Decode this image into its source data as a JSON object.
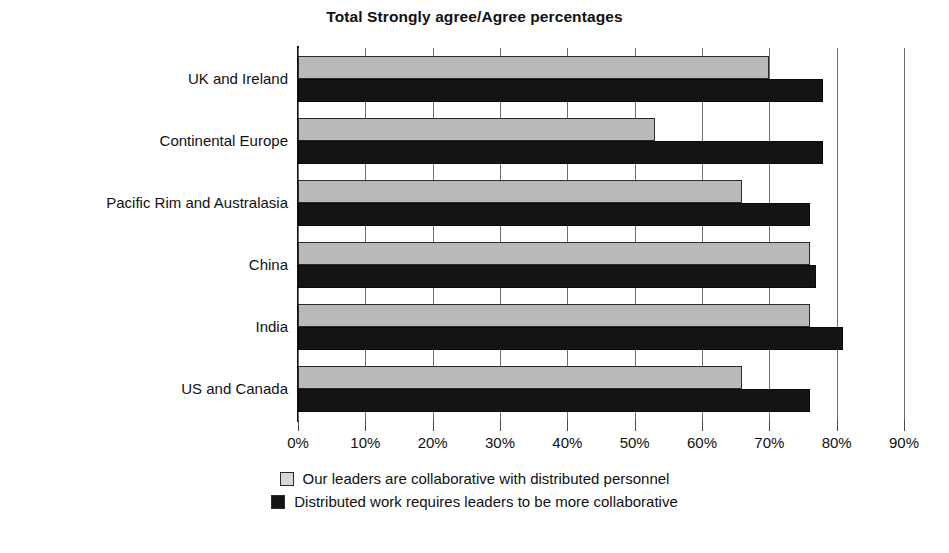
{
  "chart_data": {
    "type": "bar",
    "orientation": "horizontal",
    "title": "Total Strongly agree/Agree percentages",
    "xlabel": "",
    "ylabel": "",
    "xlim": [
      0,
      90
    ],
    "xtick_labels": [
      "0%",
      "10%",
      "20%",
      "30%",
      "40%",
      "50%",
      "60%",
      "70%",
      "80%",
      "90%"
    ],
    "xticks": [
      0,
      10,
      20,
      30,
      40,
      50,
      60,
      70,
      80,
      90
    ],
    "grid": true,
    "grid_axis": "x",
    "legend_position": "bottom",
    "categories": [
      "UK and Ireland",
      "Continental Europe",
      "Pacific Rim and Australasia",
      "China",
      "India",
      "US and Canada"
    ],
    "series": [
      {
        "name": "Our leaders are collaborative with distributed personnel",
        "color": "#b9b9b9",
        "values": [
          70,
          53,
          66,
          76,
          76,
          66
        ]
      },
      {
        "name": "Distributed work requires leaders to be more collaborative",
        "color": "#141414",
        "values": [
          78,
          78,
          76,
          77,
          81,
          76
        ]
      }
    ]
  },
  "legend": {
    "items": [
      {
        "label": "Our leaders are collaborative with distributed personnel",
        "swatch": "gray"
      },
      {
        "label": "Distributed work requires leaders to be more collaborative",
        "swatch": "black"
      }
    ]
  },
  "colors": {
    "series_gray": "#b9b9b9",
    "series_black": "#141414",
    "axis": "#111111",
    "grid": "#6f6f6f",
    "background": "#ffffff"
  }
}
